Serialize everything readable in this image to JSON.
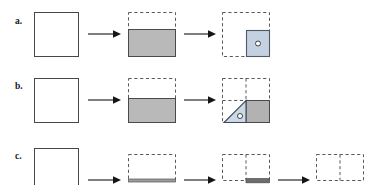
{
  "figure": {
    "title": "",
    "type": "schematic-sequence-diagram",
    "background_color": "#ffffff",
    "width": 374,
    "height": 185,
    "rows": [
      {
        "id": "a",
        "label": "a.",
        "label_x": 15,
        "label_y": 17,
        "description": "Empty square transforms to square partially filled with gray from the bottom, then to a dashed outline square containing a small blue-gray filled square with a circle at lower right.",
        "panels": [
          {
            "index": 0,
            "kind": "solid-square",
            "x": 34,
            "y": 12,
            "w": 44,
            "h": 44,
            "fill": "#ffffff",
            "stroke": "#444444",
            "stroke_style": "solid",
            "stroke_width": 1
          },
          {
            "index": 1,
            "kind": "dashed-square-with-gray-fill-bottom",
            "x": 128,
            "y": 12,
            "w": 47,
            "h": 44,
            "fill": "#b8b8b8",
            "fill_fraction": 0.62,
            "stroke": "#444444",
            "dashed_stroke": "#555555",
            "stroke_style": "dashed-top-solid-fill"
          },
          {
            "index": 2,
            "kind": "dashed-square-with-inner-blue-square",
            "x": 222,
            "y": 12,
            "w": 47,
            "h": 44,
            "stroke_style": "dashed",
            "dashed_stroke": "#555555",
            "inner": {
              "x": 245,
              "y": 30,
              "w": 24,
              "h": 26,
              "fill": "#c2cfe0",
              "stroke": "#555555",
              "circle": {
                "cx": 257,
                "cy": 43,
                "r": 2.4,
                "fill": "#ffffff",
                "stroke": "#333333"
              }
            }
          }
        ],
        "arrows": [
          {
            "x1": 88,
            "y1": 34,
            "x2": 118,
            "y2": 34
          },
          {
            "x1": 184,
            "y1": 34,
            "x2": 213,
            "y2": 34
          }
        ]
      },
      {
        "id": "b",
        "label": "b.",
        "label_x": 15,
        "label_y": 82,
        "description": "Empty square transforms to square partially filled with gray from the bottom, then to a dashed quadrant-divided square containing a triangular wedge with a circle and a gray filled right half.",
        "panels": [
          {
            "index": 0,
            "kind": "solid-square",
            "x": 34,
            "y": 78,
            "w": 44,
            "h": 44,
            "fill": "#ffffff",
            "stroke": "#444444",
            "stroke_style": "solid",
            "stroke_width": 1
          },
          {
            "index": 1,
            "kind": "dashed-square-with-gray-fill-bottom",
            "x": 128,
            "y": 78,
            "w": 47,
            "h": 44,
            "fill": "#b8b8b8",
            "fill_fraction": 0.55,
            "stroke": "#444444",
            "dashed_stroke": "#555555",
            "stroke_style": "dashed-top-solid-fill"
          },
          {
            "index": 2,
            "kind": "dashed-quad-square-with-triangle-and-gray",
            "x": 222,
            "y": 78,
            "w": 47,
            "h": 44,
            "stroke_style": "dashed",
            "dashed_stroke": "#555555",
            "triangle": {
              "fill": "#ccd8e6",
              "stroke": "#3a4a5a",
              "circle": {
                "r": 2.4,
                "fill": "#ffffff",
                "stroke": "#333333"
              }
            },
            "gray_block": {
              "fill": "#b0b0b0",
              "stroke": "#444444"
            }
          }
        ],
        "arrows": [
          {
            "x1": 88,
            "y1": 100,
            "x2": 118,
            "y2": 100
          },
          {
            "x1": 184,
            "y1": 100,
            "x2": 213,
            "y2": 100
          }
        ]
      },
      {
        "id": "c",
        "label": "c.",
        "label_x": 15,
        "label_y": 152,
        "description": "Empty square transforms to a dashed square with a thin gray strip at the bottom, then to a dashed square split into two cells with a dark gray strip under the right cell, then to a dashed two-cell square with a thin arrow beneath.",
        "panels": [
          {
            "index": 0,
            "kind": "solid-square",
            "x": 34,
            "y": 148,
            "w": 44,
            "h": 44,
            "fill": "#ffffff",
            "stroke": "#444444",
            "stroke_style": "solid",
            "stroke_width": 1
          },
          {
            "index": 1,
            "kind": "dashed-square-thin-gray-strip",
            "x": 128,
            "y": 148,
            "w": 47,
            "h": 36,
            "strip_fill": "#9a9a9a",
            "strip_height": 3,
            "dashed_stroke": "#555555"
          },
          {
            "index": 2,
            "kind": "dashed-two-cell-square-dark-strip-right",
            "x": 222,
            "y": 148,
            "w": 47,
            "h": 36,
            "strip_fill": "#6a6a6a",
            "strip_height": 4,
            "dashed_stroke": "#555555"
          },
          {
            "index": 3,
            "kind": "dashed-two-cell-square",
            "x": 316,
            "y": 148,
            "w": 47,
            "h": 36,
            "dashed_stroke": "#555555"
          }
        ],
        "arrows": [
          {
            "x1": 88,
            "y1": 180,
            "x2": 118,
            "y2": 180
          },
          {
            "x1": 184,
            "y1": 180,
            "x2": 213,
            "y2": 180
          },
          {
            "x1": 278,
            "y1": 180,
            "x2": 307,
            "y2": 180
          }
        ]
      }
    ],
    "colors": {
      "gray_fill": "#b8b8b8",
      "dark_gray_fill": "#6a6a6a",
      "blue_fill": "#c2cfe0",
      "outline": "#444444",
      "dashed_outline": "#555555",
      "arrow": "#111111",
      "label_text": "#1a1a1a"
    }
  }
}
